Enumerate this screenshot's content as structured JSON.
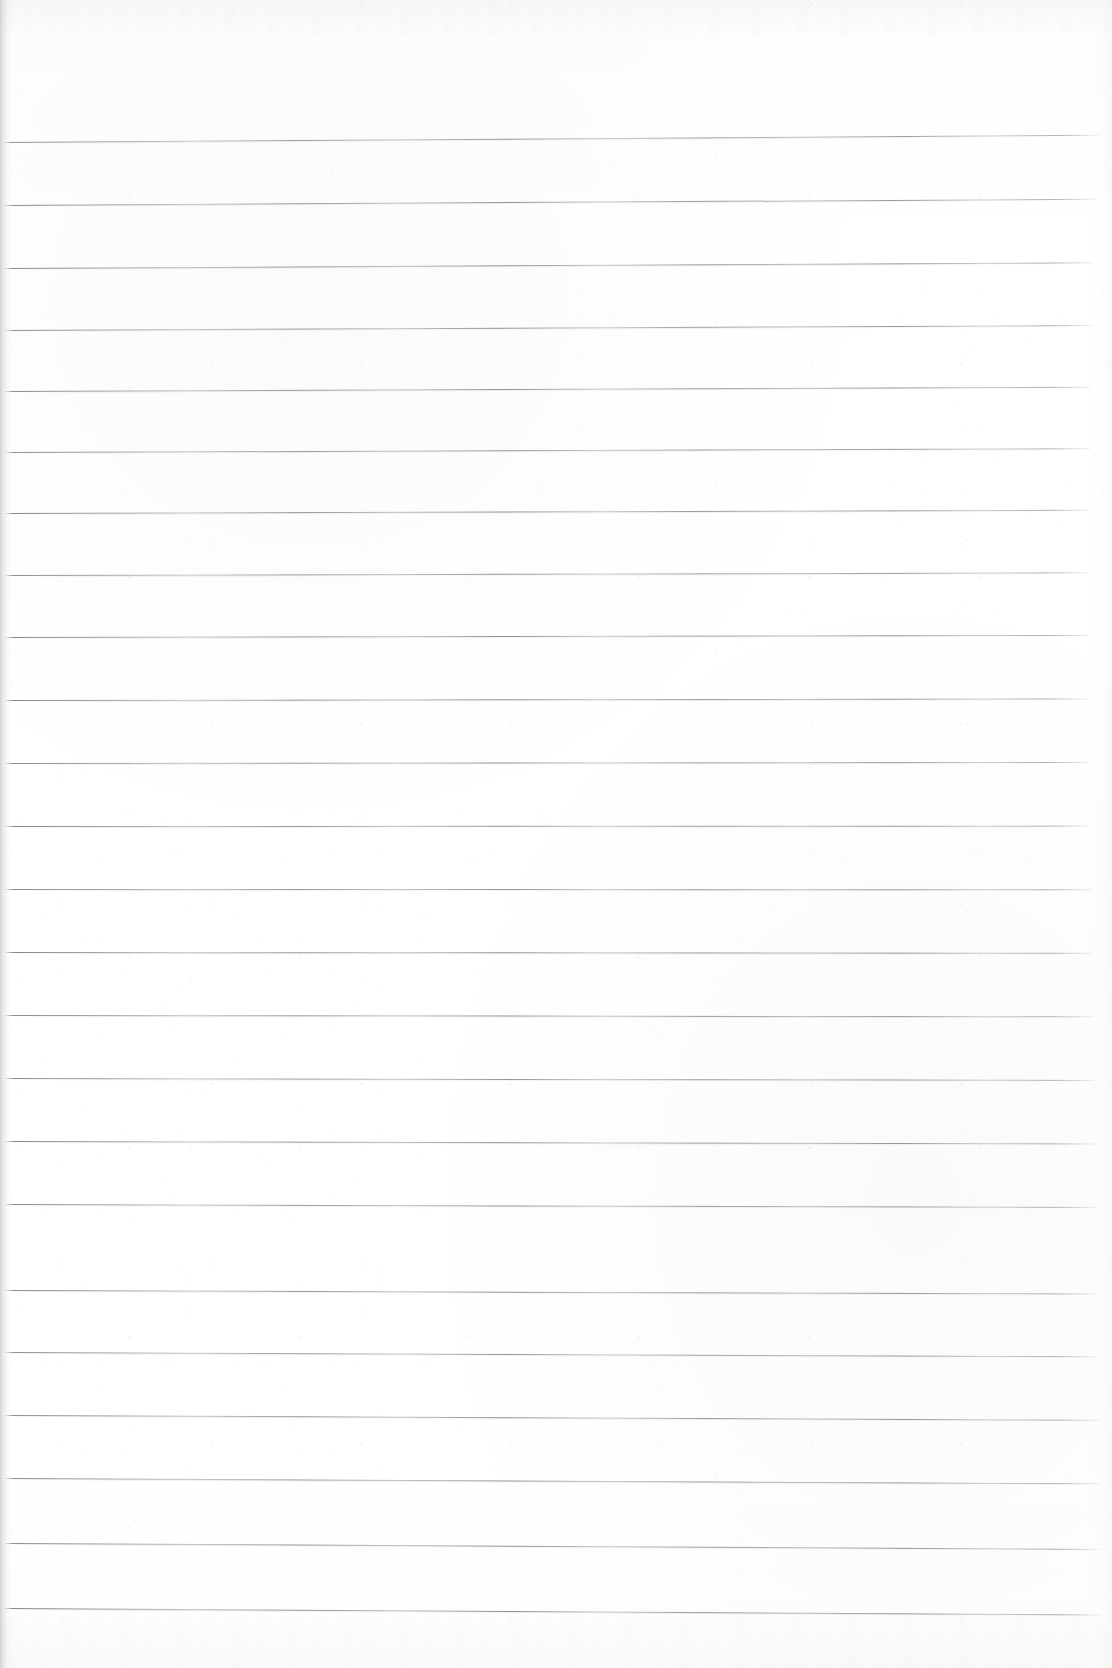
{
  "document": {
    "kind": "scanned-notebook-page",
    "title": "Blank ruled notebook page",
    "page_width": 1112,
    "page_height": 1668,
    "paper_color": "#fefefe",
    "rule_color": "#78787e",
    "edge_shadow_color": "#b0b0b4",
    "content_text": "",
    "writing": []
  },
  "ruling": {
    "style": "wide-ruled horizontal lines",
    "line_count": 24,
    "line_spacing_px": 63,
    "first_line_y": 142,
    "last_line_y": 1608,
    "left_start_x": 4,
    "right_end_x": 1100,
    "margin_line": "none",
    "top_margin_px": 142,
    "bottom_margin_px": 60,
    "lines": [
      {
        "y": 142,
        "x": 4,
        "w": 1096,
        "rot": -0.38,
        "opacity": 0.82
      },
      {
        "y": 205,
        "x": 4,
        "w": 1092,
        "rot": -0.33,
        "opacity": 0.86
      },
      {
        "y": 268,
        "x": 4,
        "w": 1090,
        "rot": -0.3,
        "opacity": 0.88
      },
      {
        "y": 330,
        "x": 5,
        "w": 1088,
        "rot": -0.26,
        "opacity": 0.84
      },
      {
        "y": 391,
        "x": 5,
        "w": 1086,
        "rot": -0.22,
        "opacity": 0.87
      },
      {
        "y": 452,
        "x": 5,
        "w": 1086,
        "rot": -0.2,
        "opacity": 0.85
      },
      {
        "y": 513,
        "x": 5,
        "w": 1085,
        "rot": -0.17,
        "opacity": 0.88
      },
      {
        "y": 575,
        "x": 5,
        "w": 1085,
        "rot": -0.14,
        "opacity": 0.83
      },
      {
        "y": 637,
        "x": 5,
        "w": 1084,
        "rot": -0.11,
        "opacity": 0.86
      },
      {
        "y": 700,
        "x": 5,
        "w": 1084,
        "rot": -0.08,
        "opacity": 0.88
      },
      {
        "y": 763,
        "x": 5,
        "w": 1085,
        "rot": -0.05,
        "opacity": 0.85
      },
      {
        "y": 826,
        "x": 5,
        "w": 1086,
        "rot": -0.02,
        "opacity": 0.87
      },
      {
        "y": 889,
        "x": 5,
        "w": 1087,
        "rot": 0.01,
        "opacity": 0.84
      },
      {
        "y": 952,
        "x": 5,
        "w": 1088,
        "rot": 0.04,
        "opacity": 0.88
      },
      {
        "y": 1015,
        "x": 5,
        "w": 1089,
        "rot": 0.07,
        "opacity": 0.86
      },
      {
        "y": 1078,
        "x": 5,
        "w": 1090,
        "rot": 0.1,
        "opacity": 0.83
      },
      {
        "y": 1101,
        "x": 5,
        "w": 1090,
        "rot": 0.11,
        "opacity": 0.0
      },
      {
        "y": 1141,
        "x": 5,
        "w": 1091,
        "rot": 0.13,
        "opacity": 0.87
      },
      {
        "y": 1204,
        "x": 5,
        "w": 1092,
        "rot": 0.16,
        "opacity": 0.85
      },
      {
        "y": 1290,
        "x": 5,
        "w": 1093,
        "rot": 0.19,
        "opacity": 0.88
      },
      {
        "y": 1352,
        "x": 5,
        "w": 1094,
        "rot": 0.22,
        "opacity": 0.84
      },
      {
        "y": 1415,
        "x": 5,
        "w": 1095,
        "rot": 0.25,
        "opacity": 0.87
      },
      {
        "y": 1478,
        "x": 5,
        "w": 1095,
        "rot": 0.28,
        "opacity": 0.85
      },
      {
        "y": 1543,
        "x": 5,
        "w": 1096,
        "rot": 0.31,
        "opacity": 0.88
      },
      {
        "y": 1608,
        "x": 4,
        "w": 1098,
        "rot": 0.34,
        "opacity": 0.9
      }
    ]
  }
}
